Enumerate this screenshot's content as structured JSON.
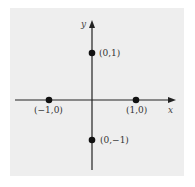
{
  "diagram": {
    "type": "coordinate-plane",
    "axes": {
      "x_label": "x",
      "y_label": "y"
    },
    "points": [
      {
        "label": "(0,1)",
        "x": 0,
        "y": 1
      },
      {
        "label": "(-1,0)",
        "x": -1,
        "y": 0
      },
      {
        "label": "(1,0)",
        "x": 1,
        "y": 0
      },
      {
        "label": "(0,−1)",
        "x": 0,
        "y": -1
      }
    ],
    "colors": {
      "background": "#eeeeee",
      "ink": "#111111"
    }
  },
  "labels": {
    "p_top": "(0,1)",
    "p_left": "(−1,0)",
    "p_right": "(1,0)",
    "p_bottom": "(0,−1)",
    "x_axis": "x",
    "y_axis": "y"
  }
}
